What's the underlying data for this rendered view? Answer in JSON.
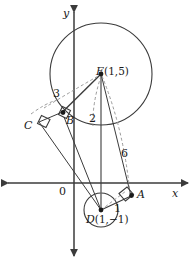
{
  "figure": {
    "type": "geometry-diagram",
    "axes": {
      "x_label": "x",
      "y_label": "y",
      "origin_label": "0"
    },
    "points": [
      {
        "id": "E",
        "name": "E",
        "coord_text": "(1,5)",
        "label": "E(1,5)",
        "px": 101,
        "py": 74
      },
      {
        "id": "D",
        "name": "D",
        "coord_text": "(1,−1)",
        "label": "D(1,−1)",
        "px": 101,
        "py": 210
      },
      {
        "id": "A",
        "name": "A",
        "coord_text": "",
        "label": "A",
        "px": 132,
        "py": 196
      },
      {
        "id": "B",
        "name": "B",
        "coord_text": "",
        "label": "B",
        "px": 64,
        "py": 114
      },
      {
        "id": "C",
        "name": "C",
        "coord_text": "",
        "label": "C",
        "px": 38,
        "py": 124
      }
    ],
    "measurements": [
      {
        "id": "CB",
        "label": "3",
        "px": 56,
        "py": 94
      },
      {
        "id": "EB-radius",
        "label": "2",
        "px": 92,
        "py": 119
      },
      {
        "id": "DE",
        "label": "6",
        "px": 124,
        "py": 154
      },
      {
        "id": "DA-radius",
        "label": "1",
        "px": 117,
        "py": 208
      }
    ],
    "circles": [
      {
        "id": "big-circle",
        "center": "E",
        "cx": 101,
        "cy": 74,
        "r": 51
      },
      {
        "id": "small-circle",
        "center": "D",
        "cx": 101,
        "cy": 210,
        "r": 17
      }
    ],
    "right_angles": [
      {
        "id": "angle-at-B",
        "vertex": "B"
      },
      {
        "id": "angle-at-C",
        "vertex": "C"
      },
      {
        "id": "angle-at-A",
        "vertex": "A"
      }
    ],
    "colors": {
      "stroke": "#3b3b3b",
      "dashed": "#8a8a8a",
      "text": "#1a1a1a",
      "background": "#ffffff"
    }
  }
}
